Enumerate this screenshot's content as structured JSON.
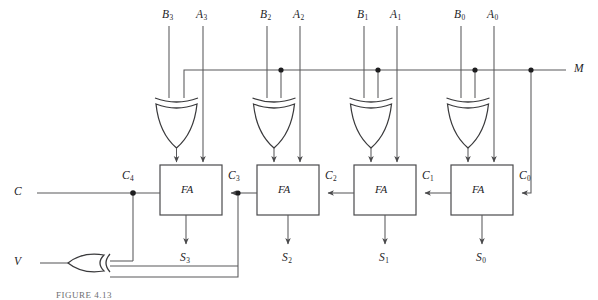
{
  "figure": {
    "caption": "FIGURE 4.13",
    "line_color": "#58585a",
    "gate_color": "#3a3a3c",
    "text_color": "#1d1d1f",
    "background": "#ffffff"
  },
  "inputs": {
    "b3": "B",
    "b3_sub": "3",
    "a3": "A",
    "a3_sub": "3",
    "b2": "B",
    "b2_sub": "2",
    "a2": "A",
    "a2_sub": "2",
    "b1": "B",
    "b1_sub": "1",
    "a1": "A",
    "a1_sub": "1",
    "b0": "B",
    "b0_sub": "0",
    "a0": "A",
    "a0_sub": "0"
  },
  "control": {
    "mode": "M",
    "carry_out": "C",
    "overflow": "V"
  },
  "blocks": [
    {
      "label": "FA",
      "name": "full-adder-3"
    },
    {
      "label": "FA",
      "name": "full-adder-2"
    },
    {
      "label": "FA",
      "name": "full-adder-1"
    },
    {
      "label": "FA",
      "name": "full-adder-0"
    }
  ],
  "carries": [
    {
      "base": "C",
      "sub": "4"
    },
    {
      "base": "C",
      "sub": "3"
    },
    {
      "base": "C",
      "sub": "2"
    },
    {
      "base": "C",
      "sub": "1"
    },
    {
      "base": "C",
      "sub": "0"
    }
  ],
  "sums": [
    {
      "base": "S",
      "sub": "3"
    },
    {
      "base": "S",
      "sub": "2"
    },
    {
      "base": "S",
      "sub": "1"
    },
    {
      "base": "S",
      "sub": "0"
    }
  ],
  "gates": {
    "xor_count": 5,
    "xor_label": "XOR",
    "overflow_gate_label": "XOR"
  }
}
